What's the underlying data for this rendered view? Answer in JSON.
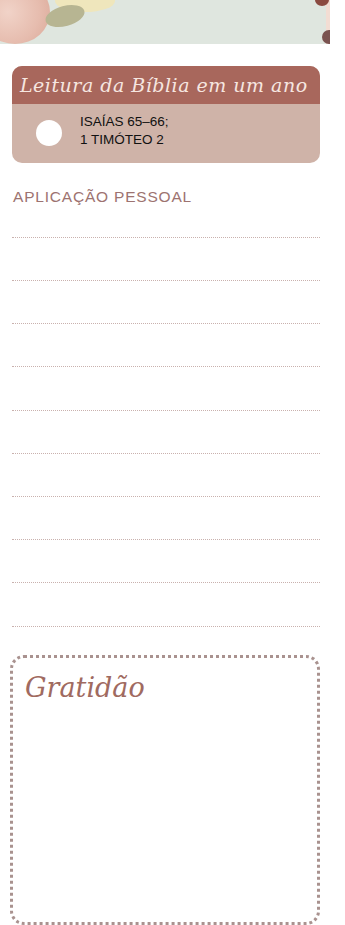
{
  "banner": {
    "description": "floral-decoration"
  },
  "reading_plan": {
    "title": "Leitura da Bíblia em um ano",
    "line1": "ISAÍAS 65–66;",
    "line2": "1 TIMÓTEO 2",
    "header_color": "#a8675c",
    "body_color": "#cfb3a8"
  },
  "personal_application": {
    "title": "APLICAÇÃO PESSOAL",
    "line_count": 10
  },
  "gratitude": {
    "title": "Gratidão"
  }
}
